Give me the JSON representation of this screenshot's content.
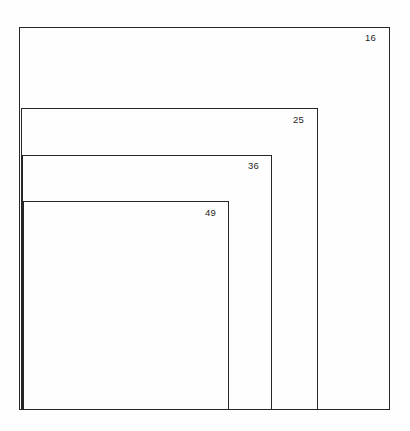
{
  "diagram": {
    "type": "nested-rectangles",
    "background_color": "#fefefe",
    "stroke_color": "#262626",
    "label_color": "#1f1f1f",
    "canvas": {
      "width": 410,
      "height": 431
    },
    "rectangles": [
      {
        "label": "16",
        "name": "rectangle-16",
        "x": 19,
        "y": 27,
        "width": 371,
        "height": 383,
        "label_x": 365,
        "label_y": 33
      },
      {
        "label": "25",
        "name": "rectangle-25",
        "x": 21,
        "y": 108,
        "width": 297,
        "height": 302,
        "label_x": 293,
        "label_y": 115
      },
      {
        "label": "36",
        "name": "rectangle-36",
        "x": 22,
        "y": 155,
        "width": 250,
        "height": 255,
        "label_x": 248,
        "label_y": 161
      },
      {
        "label": "49",
        "name": "rectangle-49",
        "x": 23,
        "y": 201,
        "width": 206,
        "height": 209,
        "label_x": 205,
        "label_y": 208
      }
    ]
  },
  "chart_data": {
    "type": "diagram",
    "title": "",
    "categories": [
      "16",
      "25",
      "36",
      "49"
    ],
    "values": [
      16,
      25,
      36,
      49
    ],
    "xlabel": "",
    "ylabel": "",
    "legend": [],
    "grid": false,
    "annotations": [
      {
        "text": "16",
        "position": "top-right-of-outermost-rectangle"
      },
      {
        "text": "25",
        "position": "top-right-of-second-rectangle"
      },
      {
        "text": "36",
        "position": "top-right-of-third-rectangle"
      },
      {
        "text": "49",
        "position": "top-right-of-innermost-rectangle"
      }
    ]
  }
}
